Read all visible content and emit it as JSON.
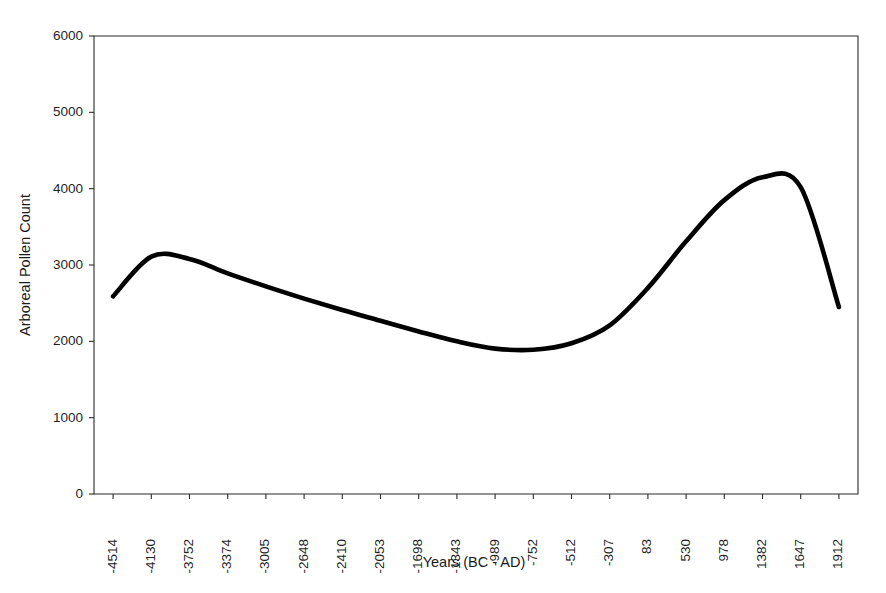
{
  "chart_data": {
    "type": "line",
    "title": "",
    "xlabel": "Years (BC - AD)",
    "ylabel": "Arboreal Pollen Count",
    "grid": false,
    "legend": false,
    "ylim": [
      0,
      6000
    ],
    "yticks": [
      0,
      1000,
      2000,
      3000,
      4000,
      5000,
      6000
    ],
    "ytick_labels": [
      "0",
      "1000",
      "2000",
      "3000",
      "4000",
      "5000",
      "6000"
    ],
    "categories": [
      "-4514",
      "-4130",
      "-3752",
      "-3374",
      "-3005",
      "-2648",
      "-2410",
      "-2053",
      "-1698",
      "-1343",
      "-989",
      "-752",
      "-512",
      "-307",
      "83",
      "530",
      "978",
      "1382",
      "1647",
      "1912"
    ],
    "series": [
      {
        "name": "Arboreal Pollen Count",
        "color": "#000000",
        "values": [
          2590,
          3110,
          3080,
          2890,
          2720,
          2560,
          2410,
          2270,
          2130,
          2000,
          1905,
          1890,
          1975,
          2210,
          2700,
          3310,
          3850,
          4150,
          4020,
          2450
        ]
      }
    ],
    "annotations": []
  },
  "axes": {
    "x_title": "Years (BC - AD)",
    "y_title": "Arboreal Pollen Count"
  }
}
